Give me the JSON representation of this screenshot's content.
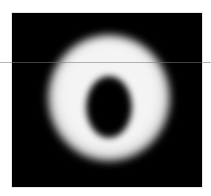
{
  "image": {
    "subject": "blurred bright ring (donut) on black background",
    "background_color": "#000000",
    "frame_color": "#ffffff",
    "ring_color": "#f4f4f4",
    "center_color": "#000000",
    "artifact": "faint horizontal scan line across image"
  }
}
